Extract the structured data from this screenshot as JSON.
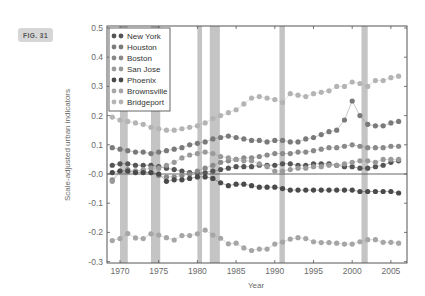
{
  "figure": {
    "badge": "FIG. 31"
  },
  "chart_data": {
    "type": "scatter",
    "title": "",
    "xlabel": "Year",
    "ylabel": "Scale-adjusted urban indicators",
    "xlim": [
      1968.3,
      2007.1
    ],
    "ylim": [
      -0.3,
      0.5
    ],
    "xticks": [
      1970,
      1975,
      1980,
      1985,
      1990,
      1995,
      2000,
      2005
    ],
    "yticks": [
      0.5,
      0.4,
      0.3,
      0.2,
      0.1,
      -0.0,
      -0.1,
      -0.2,
      -0.3
    ],
    "ytick_labels": [
      "0.5",
      "0.4",
      "0.3",
      "0.2",
      "0.1",
      "-0.0",
      "-0.1",
      "-0.2",
      "-0.3"
    ],
    "grid": false,
    "legend_position": "upper left",
    "zero_line": true,
    "shaded_periods": [
      [
        1970.0,
        1971.0
      ],
      [
        1974.0,
        1975.2
      ],
      [
        1980.0,
        1980.6
      ],
      [
        1981.6,
        1982.9
      ],
      [
        1990.6,
        1991.3
      ],
      [
        2001.2,
        2002.0
      ]
    ],
    "x": [
      1969,
      1970,
      1971,
      1972,
      1973,
      1974,
      1975,
      1976,
      1977,
      1978,
      1979,
      1980,
      1981,
      1982,
      1983,
      1984,
      1985,
      1986,
      1987,
      1988,
      1989,
      1990,
      1991,
      1992,
      1993,
      1994,
      1995,
      1996,
      1997,
      1998,
      1999,
      2000,
      2001,
      2002,
      2003,
      2004,
      2005,
      2006
    ],
    "series": [
      {
        "name": "New York",
        "color": "#555555",
        "values": [
          0.03,
          0.035,
          0.035,
          0.03,
          0.03,
          0.03,
          0.025,
          0.02,
          0.015,
          0.01,
          0.005,
          0.005,
          0.005,
          0.01,
          0.015,
          0.02,
          0.025,
          0.025,
          0.025,
          0.03,
          0.03,
          0.03,
          0.035,
          0.035,
          0.03,
          0.03,
          0.035,
          0.035,
          0.035,
          0.03,
          0.025,
          0.025,
          0.02,
          0.02,
          0.025,
          0.03,
          0.04,
          0.045
        ]
      },
      {
        "name": "Houston",
        "color": "#7a7a7a",
        "values": [
          0.09,
          0.085,
          0.08,
          0.075,
          0.075,
          0.07,
          0.075,
          0.08,
          0.085,
          0.09,
          0.1,
          0.105,
          0.11,
          0.12,
          0.125,
          0.13,
          0.125,
          0.12,
          0.115,
          0.115,
          0.11,
          0.115,
          0.115,
          0.11,
          0.11,
          0.12,
          0.125,
          0.135,
          0.145,
          0.15,
          0.185,
          0.25,
          0.2,
          0.17,
          0.165,
          0.165,
          0.175,
          0.18
        ]
      },
      {
        "name": "Boston",
        "color": "#8a8a8a",
        "values": [
          -0.02,
          0.01,
          0.015,
          0.01,
          0.01,
          0.005,
          -0.005,
          -0.01,
          -0.01,
          -0.005,
          0.0,
          0.01,
          0.02,
          0.03,
          0.04,
          0.045,
          0.05,
          0.055,
          0.055,
          0.06,
          0.065,
          0.07,
          0.07,
          0.07,
          0.075,
          0.075,
          0.08,
          0.085,
          0.09,
          0.09,
          0.095,
          0.1,
          0.095,
          0.09,
          0.09,
          0.09,
          0.095,
          0.095
        ]
      },
      {
        "name": "San Jose",
        "color": "#9a9a9a",
        "values": [
          -0.025,
          0.005,
          0.005,
          0.01,
          0.015,
          0.02,
          0.02,
          0.03,
          0.04,
          0.055,
          0.065,
          0.07,
          0.075,
          0.07,
          0.06,
          0.055,
          0.05,
          0.045,
          0.045,
          0.035,
          0.025,
          0.01,
          0.01,
          0.015,
          0.02,
          0.02,
          0.025,
          0.025,
          0.03,
          0.03,
          0.035,
          0.04,
          0.045,
          0.045,
          0.04,
          0.05,
          0.05,
          0.05
        ]
      },
      {
        "name": "Phoenix",
        "color": "#4a4a4a",
        "values": [
          0.005,
          0.01,
          0.01,
          0.005,
          0.005,
          0.005,
          0.0,
          -0.025,
          -0.02,
          -0.02,
          -0.015,
          -0.01,
          -0.01,
          -0.015,
          -0.03,
          -0.04,
          -0.035,
          -0.035,
          -0.04,
          -0.045,
          -0.045,
          -0.045,
          -0.05,
          -0.055,
          -0.055,
          -0.055,
          -0.055,
          -0.055,
          -0.055,
          -0.055,
          -0.055,
          -0.055,
          -0.06,
          -0.06,
          -0.06,
          -0.06,
          -0.06,
          -0.065
        ]
      },
      {
        "name": "Brownsville",
        "color": "#a6a6a6",
        "values": [
          -0.228,
          -0.221,
          -0.204,
          -0.219,
          -0.221,
          -0.205,
          -0.209,
          -0.218,
          -0.226,
          -0.211,
          -0.211,
          -0.205,
          -0.192,
          -0.209,
          -0.22,
          -0.239,
          -0.237,
          -0.253,
          -0.262,
          -0.257,
          -0.257,
          -0.24,
          -0.233,
          -0.223,
          -0.218,
          -0.221,
          -0.232,
          -0.235,
          -0.235,
          -0.237,
          -0.24,
          -0.24,
          -0.232,
          -0.225,
          -0.225,
          -0.234,
          -0.234,
          -0.237
        ]
      },
      {
        "name": "Bridgeport",
        "color": "#b4b4b4",
        "values": [
          0.195,
          0.185,
          0.18,
          0.175,
          0.17,
          0.16,
          0.155,
          0.15,
          0.15,
          0.155,
          0.16,
          0.165,
          0.175,
          0.19,
          0.2,
          0.21,
          0.22,
          0.24,
          0.26,
          0.265,
          0.26,
          0.255,
          0.245,
          0.275,
          0.27,
          0.265,
          0.275,
          0.28,
          0.285,
          0.3,
          0.3,
          0.315,
          0.31,
          0.3,
          0.32,
          0.32,
          0.33,
          0.335
        ]
      }
    ]
  }
}
